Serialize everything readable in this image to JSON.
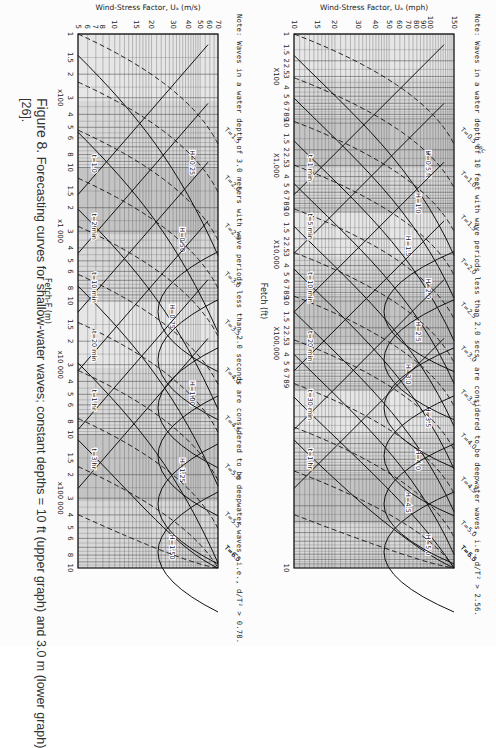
{
  "caption": {
    "figure_label": "Figure 8.",
    "text": "Forecasting curves for shallow-water waves; constant depths = 10 ft (upper graph) and 3.0 m (lower graph)",
    "reference": "[26]."
  },
  "upper_note": "Note: Waves in a water depth of 10 feet with wave periods less than 2.0 secs. are considered to be deepwater waves, i.e. d/T² > 2.56.",
  "lower_note": "Note: Waves in a water depth of 3.0 meters with wave periods less than 2.0 seconds are considered to be deepwater waves, i.e., d/T² > 0.78.",
  "chart_data": [
    {
      "type": "line",
      "title": "Shallow-water forecasting curves, constant depth = 10 ft",
      "xlabel": "Fetch (ft)",
      "ylabel": "Wind-Stress Factor, U_A (mph)",
      "xscale": "log",
      "yscale": "log",
      "xlim": [
        1,
        1000000
      ],
      "ylim": [
        10,
        150
      ],
      "grid": true,
      "x_tick_labels": [
        "1",
        "1.5",
        "2",
        "2.5",
        "3",
        "4",
        "5",
        "6",
        "7",
        "8",
        "9",
        "10",
        "1.5",
        "2",
        "2.5",
        "3",
        "4",
        "5",
        "6",
        "7",
        "8",
        "9",
        "10",
        "1.5",
        "2",
        "2.5",
        "3",
        "4",
        "5",
        "6",
        "7",
        "8",
        "9",
        "10",
        "1.5",
        "2",
        "2.5",
        "3",
        "4",
        "5",
        "6",
        "7",
        "8",
        "9",
        "10"
      ],
      "x_multipliers": [
        "X100",
        "X1,000",
        "X10,000",
        "X100,000"
      ],
      "y_tick_labels": [
        "150",
        "100",
        "90",
        "80",
        "70",
        "60",
        "50",
        "40",
        "30",
        "20",
        "15",
        "10"
      ],
      "series": [
        {
          "name": "H (ft)",
          "style": "solid",
          "labels": [
            "H=0.5 ft",
            "H=1.0",
            "H=1.5",
            "H=2.0",
            "H=2.5",
            "H=3.0",
            "H=3.5",
            "H=4.0",
            "H=4.5",
            "H=5.0"
          ]
        },
        {
          "name": "T (sec)",
          "style": "dashed",
          "labels": [
            "T=0.5 sec",
            "T=1.0",
            "T=1.5",
            "T=2.0",
            "T=2.5",
            "T=3.0",
            "T=3.5",
            "T=4.0",
            "T=4.5",
            "T=5.0",
            "T=5.5",
            "T=6.0"
          ]
        },
        {
          "name": "t (min, duration)",
          "style": "solid-diagonal",
          "labels": [
            "t=1 min",
            "t=5 min",
            "t=10 min",
            "t=20 min",
            "t=30 min",
            "t=1 hr"
          ]
        }
      ]
    },
    {
      "type": "line",
      "title": "Shallow-water forecasting curves, constant depth = 3.0 m",
      "xlabel": "Fetch-F (m)",
      "ylabel": "Wind-Stress Factor, U_A (m/s)",
      "xscale": "log",
      "yscale": "log",
      "xlim": [
        100,
        1000000
      ],
      "ylim": [
        5,
        70
      ],
      "grid": true,
      "x_tick_labels": [
        "1",
        "1.5",
        "2",
        "3",
        "4",
        "5",
        "6",
        "8",
        "10",
        "1.5",
        "2",
        "3",
        "4",
        "5",
        "6",
        "8",
        "10",
        "1.5",
        "2",
        "3",
        "4",
        "5",
        "6",
        "8",
        "10",
        "1.5",
        "2",
        "3",
        "4",
        "5",
        "6",
        "8",
        "10"
      ],
      "x_multipliers": [
        "x100",
        "x1 000",
        "x10 000",
        "x100 000"
      ],
      "y_tick_labels": [
        "70",
        "60",
        "50",
        "40",
        "30",
        "20",
        "15",
        "10",
        "8",
        "7",
        "6",
        "5"
      ],
      "series": [
        {
          "name": "H (m)",
          "style": "solid",
          "labels": [
            "H=0.25",
            "H=0.50",
            "H=0.75",
            "H=1.00",
            "H=1.25",
            "H=1.50"
          ]
        },
        {
          "name": "T (sec)",
          "style": "dashed",
          "labels": [
            "T=1.5",
            "T=2.0",
            "T=2.5",
            "T=3.0",
            "T=3.5",
            "T=4.0",
            "T=4.5",
            "T=5.0",
            "T=5.5",
            "T=6.0",
            "T=6.5"
          ]
        },
        {
          "name": "t (duration)",
          "style": "solid-diagonal",
          "labels": [
            "t=1.0",
            "t=2 min",
            "t=10 min",
            "t=20 min",
            "t=1 hr",
            "t=3 hr"
          ]
        }
      ]
    }
  ]
}
